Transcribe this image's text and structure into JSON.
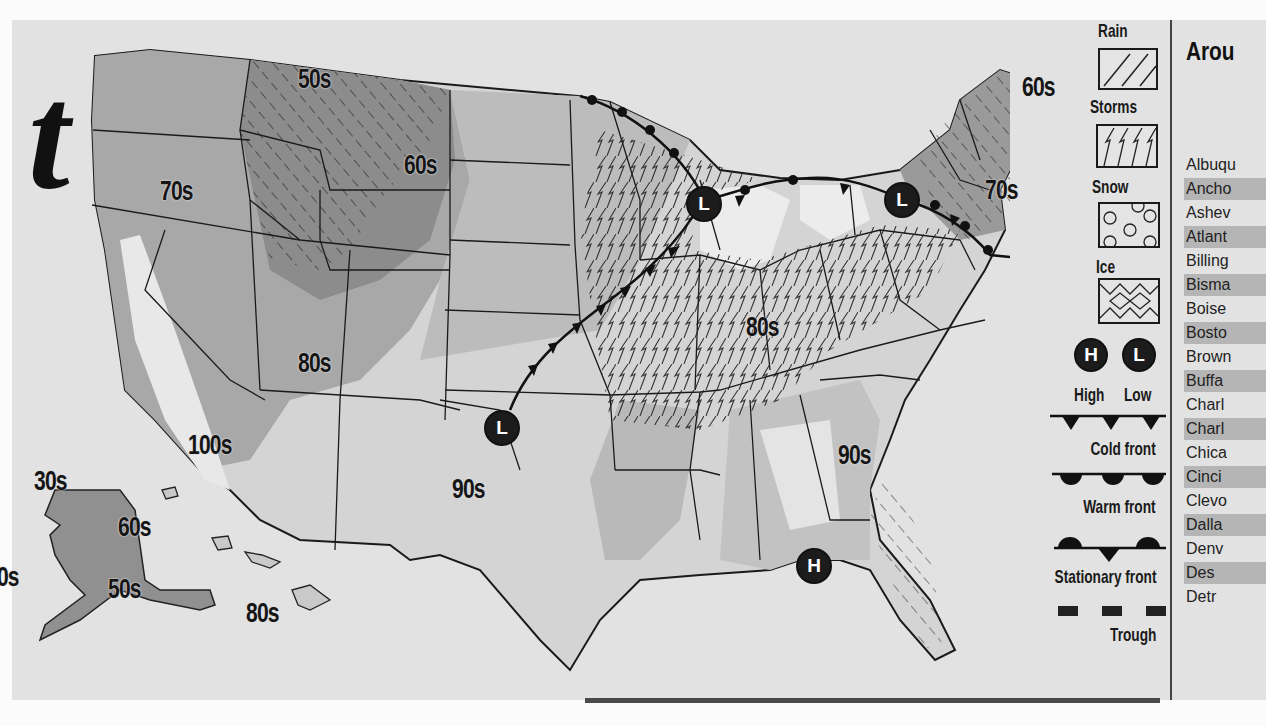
{
  "page": {
    "heading_fragment": "t",
    "type": "newspaper weather forecast map"
  },
  "map": {
    "temperature_labels": [
      {
        "text": "50s",
        "region": "northern-rockies"
      },
      {
        "text": "60s",
        "region": "northern-plains-west"
      },
      {
        "text": "70s",
        "region": "pacific-northwest"
      },
      {
        "text": "60s",
        "region": "northern-new-england"
      },
      {
        "text": "70s",
        "region": "new-england-south"
      },
      {
        "text": "80s",
        "region": "four-corners"
      },
      {
        "text": "80s",
        "region": "ohio-valley"
      },
      {
        "text": "100s",
        "region": "desert-southwest"
      },
      {
        "text": "90s",
        "region": "southern-plains"
      },
      {
        "text": "90s",
        "region": "southeast"
      },
      {
        "text": "30s",
        "region": "alaska-north"
      },
      {
        "text": "60s",
        "region": "alaska-interior"
      },
      {
        "text": "40s",
        "region": "alaska-west"
      },
      {
        "text": "50s",
        "region": "alaska-south"
      },
      {
        "text": "80s",
        "region": "hawaii"
      }
    ],
    "pressure_systems": [
      {
        "type": "L",
        "label": "Low",
        "location": "upper-midwest"
      },
      {
        "type": "L",
        "label": "Low",
        "location": "northeast"
      },
      {
        "type": "L",
        "label": "Low",
        "location": "southern-plains"
      },
      {
        "type": "H",
        "label": "High",
        "location": "gulf-coast"
      }
    ]
  },
  "legend": {
    "precip": [
      {
        "label": "Rain",
        "pattern": "diagonal-lines"
      },
      {
        "label": "Storms",
        "pattern": "zigzag-bolts"
      },
      {
        "label": "Snow",
        "pattern": "circles"
      },
      {
        "label": "Ice",
        "pattern": "diamonds"
      }
    ],
    "high_label": "High",
    "low_label": "Low",
    "high_symbol": "H",
    "low_symbol": "L",
    "fronts": [
      {
        "label": "Cold front",
        "symbol": "triangles"
      },
      {
        "label": "Warm front",
        "symbol": "semicircles"
      },
      {
        "label": "Stationary front",
        "symbol": "alternating"
      },
      {
        "label": "Trough",
        "symbol": "dashes"
      }
    ]
  },
  "around": {
    "title": "Arou",
    "cities": [
      {
        "name": "Albuqu",
        "shaded": false
      },
      {
        "name": "Ancho",
        "shaded": true
      },
      {
        "name": "Ashev",
        "shaded": false
      },
      {
        "name": "Atlant",
        "shaded": true
      },
      {
        "name": "Billing",
        "shaded": false
      },
      {
        "name": "Bisma",
        "shaded": true
      },
      {
        "name": "Boise",
        "shaded": false
      },
      {
        "name": "Bosto",
        "shaded": true
      },
      {
        "name": "Brown",
        "shaded": false
      },
      {
        "name": "Buffa",
        "shaded": true
      },
      {
        "name": "Charl",
        "shaded": false
      },
      {
        "name": "Charl",
        "shaded": true
      },
      {
        "name": "Chica",
        "shaded": false
      },
      {
        "name": "Cinci",
        "shaded": true
      },
      {
        "name": "Clevo",
        "shaded": false
      },
      {
        "name": "Dalla",
        "shaded": true
      },
      {
        "name": "Denv",
        "shaded": false
      },
      {
        "name": "Des",
        "shaded": true
      },
      {
        "name": "Detr",
        "shaded": false
      }
    ]
  },
  "colors": {
    "paper": "#e2e2e2",
    "ink": "#1a1a1a",
    "band_cool": "#8a8a8a",
    "band_mid": "#a6a6a6",
    "band_warm": "#c4c4c4",
    "band_hot": "#dadada"
  }
}
